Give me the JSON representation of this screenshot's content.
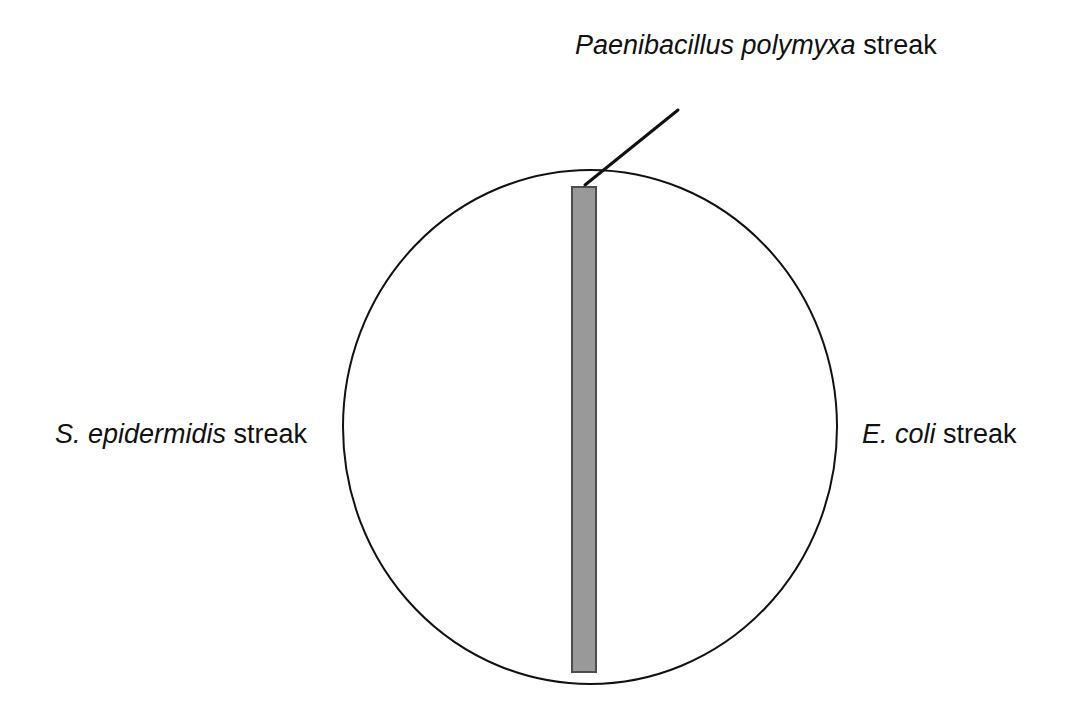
{
  "figure": {
    "type": "schematic-diagram",
    "background_color": "#ffffff",
    "stroke_color": "#111111",
    "streak_fill_color": "#999999",
    "streak_border_color": "#4d4d4d"
  },
  "labels": {
    "top": {
      "species": "Paenibacillus polymyxa",
      "suffix": " streak",
      "leader_line": true
    },
    "left": {
      "species": "S. epidermidis",
      "suffix": " streak",
      "leader_line": false
    },
    "right": {
      "species": "E. coli",
      "suffix": " streak",
      "leader_line": false
    }
  },
  "shapes": {
    "plate": {
      "name": "petri-dish-outline",
      "cx": 590,
      "cy": 427,
      "rx": 247,
      "ry": 257,
      "stroke_width": 2,
      "fill": "none"
    },
    "central_streak": {
      "name": "central-vertical-streak",
      "x": 572,
      "y": 187,
      "width": 24,
      "height": 485,
      "stroke_width": 2
    },
    "leader": {
      "name": "leader-line-to-central-streak",
      "x1": 678,
      "y1": 110,
      "x2": 585,
      "y2": 185,
      "stroke_width": 3
    }
  }
}
